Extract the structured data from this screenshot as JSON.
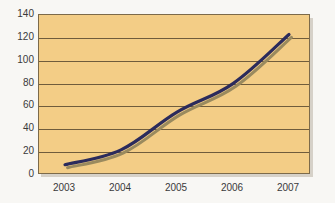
{
  "chart_data": {
    "type": "line",
    "title": "",
    "subtitle": "",
    "xlabel": "",
    "ylabel": "",
    "categories": [
      "2003",
      "2004",
      "2005",
      "2006",
      "2007"
    ],
    "x": [
      2003,
      2004,
      2005,
      2006,
      2007
    ],
    "series": [
      {
        "name": "",
        "values": [
          9,
          22,
          55,
          80,
          123
        ],
        "color": "#2b2b5c",
        "line_width": 3,
        "markers": false,
        "shadow_color": "#9a8a5e"
      }
    ],
    "ylim": [
      0,
      140
    ],
    "yticks": [
      0,
      20,
      40,
      60,
      80,
      100,
      120,
      140
    ],
    "ytick_labels": [
      "0",
      "20",
      "40",
      "60",
      "80",
      "100",
      "120",
      "140"
    ],
    "xtick_labels": [
      "2003",
      "2004",
      "2005",
      "2006",
      "2007"
    ],
    "grid": true,
    "grid_axis": "y",
    "grid_color": "#6f5c3c",
    "legend": false,
    "legend_position": "none",
    "annotations": [],
    "plot_background": "#f3cd86",
    "figure_background": "#f8f7f4",
    "border_color": "#7c6a4a",
    "tick_label_color": "#3a3a3a"
  }
}
